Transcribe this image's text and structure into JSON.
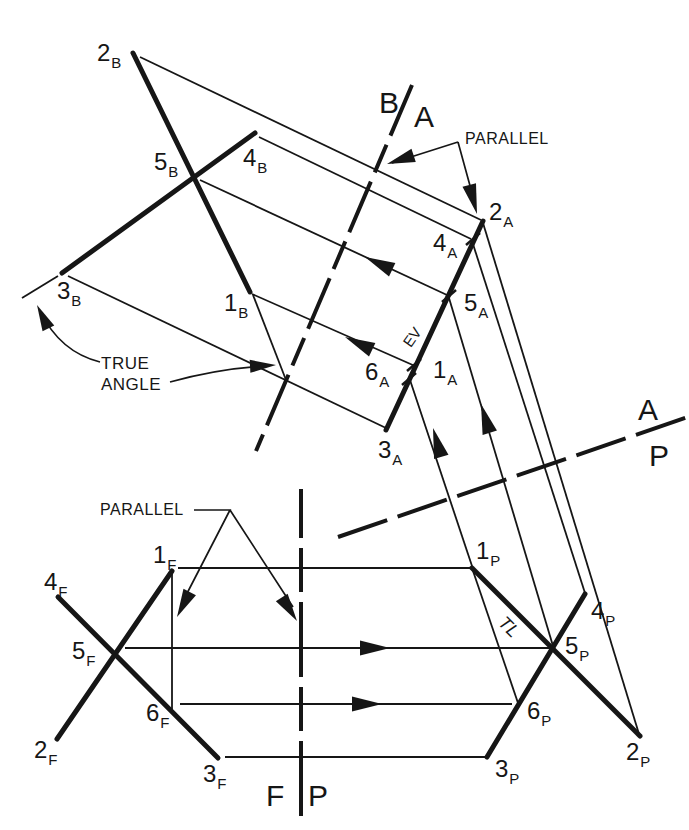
{
  "figure": {
    "background": "#ffffff",
    "ink": "#161616"
  },
  "point_labels": [
    {
      "name": "2B",
      "num": "2",
      "sub": "B",
      "x": 97,
      "y": 41
    },
    {
      "name": "5B",
      "num": "5",
      "sub": "B",
      "x": 154,
      "y": 150
    },
    {
      "name": "4B",
      "num": "4",
      "sub": "B",
      "x": 243,
      "y": 146
    },
    {
      "name": "3B",
      "num": "3",
      "sub": "B",
      "x": 57,
      "y": 279
    },
    {
      "name": "1B",
      "num": "1",
      "sub": "B",
      "x": 224,
      "y": 291
    },
    {
      "name": "2A",
      "num": "2",
      "sub": "A",
      "x": 489,
      "y": 200
    },
    {
      "name": "4A",
      "num": "4",
      "sub": "A",
      "x": 433,
      "y": 231
    },
    {
      "name": "5A",
      "num": "5",
      "sub": "A",
      "x": 464,
      "y": 291
    },
    {
      "name": "6A",
      "num": "6",
      "sub": "A",
      "x": 365,
      "y": 360
    },
    {
      "name": "1A",
      "num": "1",
      "sub": "A",
      "x": 433,
      "y": 358
    },
    {
      "name": "3A",
      "num": "3",
      "sub": "A",
      "x": 378,
      "y": 438
    },
    {
      "name": "1F",
      "num": "1",
      "sub": "F",
      "x": 153,
      "y": 543
    },
    {
      "name": "4F",
      "num": "4",
      "sub": "F",
      "x": 44,
      "y": 570
    },
    {
      "name": "5F",
      "num": "5",
      "sub": "F",
      "x": 72,
      "y": 639
    },
    {
      "name": "6F",
      "num": "6",
      "sub": "F",
      "x": 146,
      "y": 701
    },
    {
      "name": "2F",
      "num": "2",
      "sub": "F",
      "x": 34,
      "y": 738
    },
    {
      "name": "3F",
      "num": "3",
      "sub": "F",
      "x": 203,
      "y": 762
    },
    {
      "name": "1P",
      "num": "1",
      "sub": "P",
      "x": 476,
      "y": 539
    },
    {
      "name": "4P",
      "num": "4",
      "sub": "P",
      "x": 591,
      "y": 599
    },
    {
      "name": "5P",
      "num": "5",
      "sub": "P",
      "x": 565,
      "y": 634
    },
    {
      "name": "6P",
      "num": "6",
      "sub": "P",
      "x": 527,
      "y": 699
    },
    {
      "name": "2P",
      "num": "2",
      "sub": "P",
      "x": 626,
      "y": 740
    },
    {
      "name": "3P",
      "num": "3",
      "sub": "P",
      "x": 495,
      "y": 757
    }
  ],
  "fold_labels": [
    {
      "name": "fold-label-B",
      "text": "B",
      "x": 379,
      "y": 88
    },
    {
      "name": "fold-label-A-top",
      "text": "A",
      "x": 414,
      "y": 102
    },
    {
      "name": "fold-label-A-right",
      "text": "A",
      "x": 638,
      "y": 395
    },
    {
      "name": "fold-label-P-right",
      "text": "P",
      "x": 649,
      "y": 441
    },
    {
      "name": "fold-label-F",
      "text": "F",
      "x": 266,
      "y": 781
    },
    {
      "name": "fold-label-P-bottom",
      "text": "P",
      "x": 308,
      "y": 781
    }
  ],
  "annotations": {
    "parallel_top": "PARALLEL",
    "parallel_bottom": "PARALLEL",
    "true_angle_line1": "TRUE",
    "true_angle_line2": "ANGLE",
    "edge_view": "EV",
    "true_length": "TL"
  }
}
